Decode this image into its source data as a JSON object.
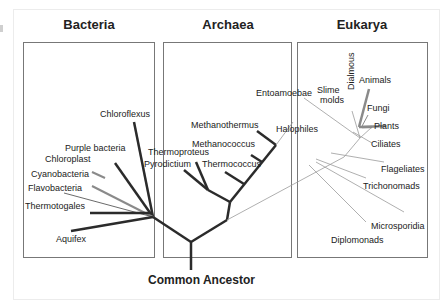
{
  "diagram": {
    "type": "phylogenetic-tree",
    "root_label": "Common Ancestor",
    "domains": [
      {
        "name": "Bacteria",
        "taxa": [
          "Chloroflexus",
          "Purple bacteria",
          "Chloroplast",
          "Cyanobacteria",
          "Flavobacteria",
          "Thermotogales",
          "Aquifex"
        ]
      },
      {
        "name": "Archaea",
        "taxa": [
          "Methanothermus",
          "Methanococcus",
          "Thermoproteus",
          "Pyrodictium",
          "Thermococcus",
          "Halophiles"
        ]
      },
      {
        "name": "Eukarya",
        "taxa": [
          "Entoamoebae",
          "Slime molds",
          "Dialmous",
          "Animals",
          "Fungi",
          "Plants",
          "Ciliates",
          "Flageliates",
          "Trichonomads",
          "Microsporidia",
          "Diplomonads"
        ]
      }
    ]
  },
  "labels": {
    "bacteria": "Bacteria",
    "archaea": "Archaea",
    "eukarya": "Eukarya",
    "chloroflexus": "Chloroflexus",
    "purple_bacteria": "Purple bacteria",
    "chloroplast": "Chloroplast",
    "cyanobacteria": "Cyanobacteria",
    "flavobacteria": "Flavobacteria",
    "thermotogales": "Thermotogales",
    "aquifex": "Aquifex",
    "methanothermus": "Methanothermus",
    "methanococcus": "Methanococcus",
    "thermoproteus": "Thermoproteus",
    "pyrodictium": "Pyrodictium",
    "thermococcus": "Thermococcus",
    "halophiles": "Halophiles",
    "entoamoebae": "Entoamoebae",
    "slime": "Slime",
    "molds": "molds",
    "dialmous": "Dialmous",
    "animals": "Animals",
    "fungi": "Fungi",
    "plants": "Plants",
    "ciliates": "Ciliates",
    "flageliates": "Flageliates",
    "trichonomads": "Trichonomads",
    "microsporidia": "Microsporidia",
    "diplomonads": "Diplomonads",
    "common_ancestor": "Common Ancestor"
  },
  "colors": {
    "thick_branch": "#2b2b2b",
    "thin_branch": "#9a9a9a",
    "gray_branch": "#8a8a8a",
    "box_border": "#777777"
  }
}
